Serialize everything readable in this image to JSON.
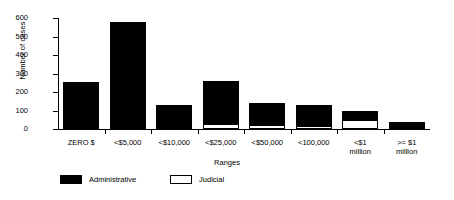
{
  "chart_data": {
    "type": "bar",
    "stacked": true,
    "title": "",
    "xlabel": "Ranges",
    "ylabel": "Number of cases",
    "categories": [
      "ZERO $",
      "<$5,000",
      "<$10,000",
      "<$25,000",
      "<$50,000",
      "<100,000",
      "<$1\nmillion",
      ">= $1\nmillion"
    ],
    "series": [
      {
        "name": "Administrative",
        "color": "#000000",
        "values": [
          255,
          578,
          130,
          235,
          120,
          112,
          50,
          38
        ]
      },
      {
        "name": "Judicial",
        "color": "#ffffff",
        "values": [
          0,
          0,
          0,
          25,
          20,
          18,
          48,
          0
        ]
      }
    ],
    "totals": [
      255,
      578,
      130,
      260,
      140,
      130,
      98,
      38
    ],
    "ylim": [
      0,
      600
    ],
    "yticks": [
      0,
      100,
      200,
      300,
      400,
      500,
      600
    ],
    "ytick_labels": [
      "0",
      "100",
      "200",
      "300",
      "400",
      "500",
      "600"
    ],
    "grid": false,
    "legend_position": "bottom-left"
  },
  "axes": {
    "ylabel": "Number of cases",
    "xlabel": "Ranges"
  },
  "legend": {
    "entries": [
      {
        "label": "Administrative",
        "style": "filled"
      },
      {
        "label": "Judicial",
        "style": "hollow"
      }
    ]
  }
}
